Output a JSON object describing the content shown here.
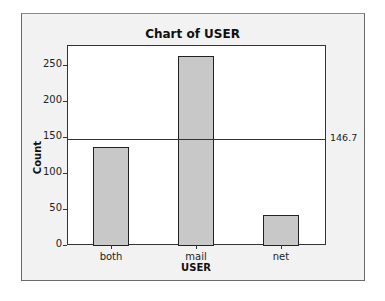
{
  "chart_data": {
    "type": "bar",
    "title": "Chart of USER",
    "xlabel": "USER",
    "ylabel": "Count",
    "categories": [
      "both",
      "mail",
      "net"
    ],
    "values": [
      136,
      262,
      42
    ],
    "ylim": [
      0,
      278
    ],
    "yticks": [
      0,
      50,
      100,
      150,
      200,
      250
    ],
    "reference_line": {
      "value": 146.7,
      "label": "146.7"
    },
    "grid": false,
    "legend": null,
    "bar_color": "#c8c8c8"
  },
  "labels": {
    "title": "Chart of USER",
    "xlabel": "USER",
    "ylabel": "Count",
    "ref": "146.7",
    "yticks": [
      "0",
      "50",
      "100",
      "150",
      "200",
      "250"
    ],
    "cats": [
      "both",
      "mail",
      "net"
    ]
  }
}
